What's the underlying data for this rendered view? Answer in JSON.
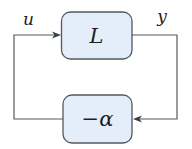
{
  "diagram": {
    "type": "feedback-loop",
    "blocks": {
      "forward": {
        "label": "L"
      },
      "feedback": {
        "label": "−α"
      }
    },
    "signals": {
      "input": {
        "label": "u"
      },
      "output": {
        "label": "y"
      }
    },
    "colors": {
      "block_fill": "#e4eefa",
      "block_stroke": "#54585e",
      "wire": "#555a60",
      "text": "#1e1e22"
    }
  }
}
